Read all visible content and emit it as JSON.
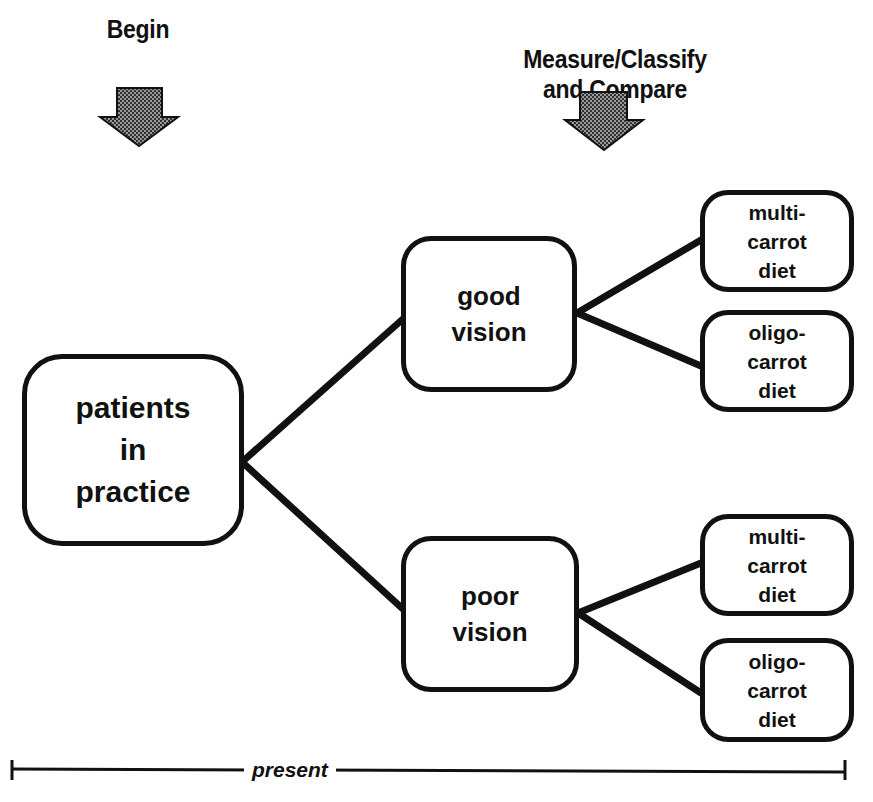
{
  "stages": {
    "begin": {
      "label": "Begin"
    },
    "measure": {
      "label": "Measure/Classify\nand Compare"
    }
  },
  "arrows": {
    "begin_arrow": {
      "icon": "down-arrow-icon",
      "fill": "#6e6e6e"
    },
    "measure_arrow": {
      "icon": "down-arrow-icon",
      "fill": "#6e6e6e"
    }
  },
  "nodes": {
    "root": {
      "label": "patients\nin\npractice"
    },
    "good_vision": {
      "label": "good\nvision"
    },
    "poor_vision": {
      "label": "poor\nvision"
    },
    "good_multi": {
      "label": "multi-\ncarrot\ndiet"
    },
    "good_oligo": {
      "label": "oligo-\ncarrot\ndiet"
    },
    "poor_multi": {
      "label": "multi-\ncarrot\ndiet"
    },
    "poor_oligo": {
      "label": "oligo-\ncarrot\ndiet"
    }
  },
  "timeline": {
    "label": "present"
  },
  "colors": {
    "stroke": "#111111",
    "background": "#ffffff",
    "arrow_fill": "#6e6e6e"
  }
}
